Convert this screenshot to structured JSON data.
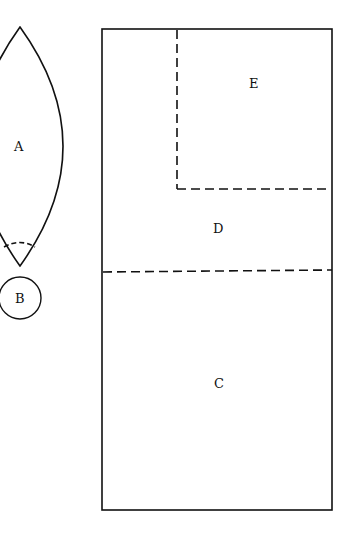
{
  "diagram": {
    "stroke_color": "#111111",
    "background": "#ffffff",
    "labels": {
      "A": "A",
      "B": "B",
      "C": "C",
      "D": "D",
      "E": "E"
    },
    "shapes": {
      "lens": {
        "label": "A",
        "top_tip": [
          20,
          27
        ],
        "bottom_tip": [
          20,
          266
        ],
        "bulge_x": 63
      },
      "circle": {
        "label": "B",
        "center": [
          20,
          298
        ],
        "radius": 22
      },
      "rectangle": {
        "left": 102,
        "top": 29,
        "right": 332,
        "bottom": 510
      },
      "region_E": {
        "label": "E",
        "dashed_vertical_x": 177,
        "dashed_horizontal_y": 189
      },
      "region_D": {
        "label": "D",
        "bottom_dashed_y": 271
      },
      "region_C": {
        "label": "C"
      }
    }
  }
}
